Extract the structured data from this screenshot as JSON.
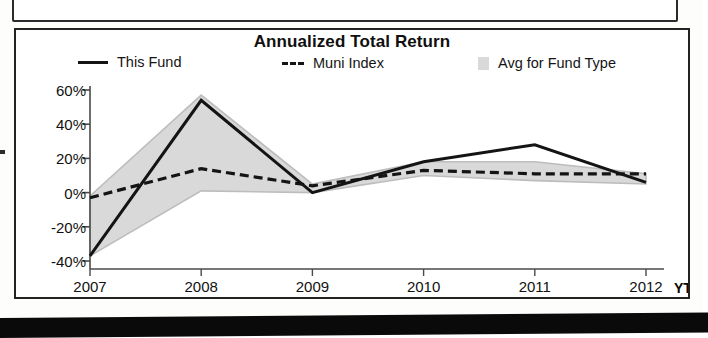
{
  "chart_panel": {
    "title": "Annualized Total Return"
  },
  "legend": {
    "items": [
      {
        "label": "This Fund",
        "marker": "solid-line-swatch",
        "color": "#141414"
      },
      {
        "label": "Muni Index",
        "marker": "dashed-line-swatch",
        "color": "#141414"
      },
      {
        "label": "Avg for Fund Type",
        "marker": "gray-band-swatch",
        "color": "#d9d9d9"
      }
    ]
  },
  "axes": {
    "y_ticks": [
      "60%",
      "40%",
      "20%",
      "0%",
      "-20%",
      "-40%"
    ],
    "x_ticks": [
      "2007",
      "2008",
      "2009",
      "2010",
      "2011",
      "2012"
    ],
    "x_suffix": "YTD"
  },
  "chart_data": {
    "type": "line",
    "title": "Annualized Total Return",
    "xlabel": "",
    "ylabel": "",
    "x": [
      "2007",
      "2008",
      "2009",
      "2010",
      "2011",
      "2012"
    ],
    "x_suffix_label": "YTD",
    "ylim": [
      -40,
      60
    ],
    "ytick_values": [
      60,
      40,
      20,
      0,
      -20,
      -40
    ],
    "ytick_labels": [
      "60%",
      "40%",
      "20%",
      "0%",
      "-20%",
      "-40%"
    ],
    "grid": false,
    "legend_position": "top",
    "series": [
      {
        "name": "This Fund",
        "style": "solid",
        "color": "#141414",
        "values": [
          -37,
          54,
          0,
          18,
          28,
          6
        ]
      },
      {
        "name": "Muni Index",
        "style": "dashed",
        "color": "#141414",
        "values": [
          -3,
          14,
          4,
          13,
          11,
          11
        ]
      },
      {
        "name": "Avg for Fund Type",
        "style": "band",
        "color": "#d9d9d9",
        "upper": [
          -2,
          57,
          5,
          18,
          18,
          11
        ],
        "lower": [
          -37,
          1,
          0,
          10,
          7,
          5
        ]
      }
    ]
  }
}
